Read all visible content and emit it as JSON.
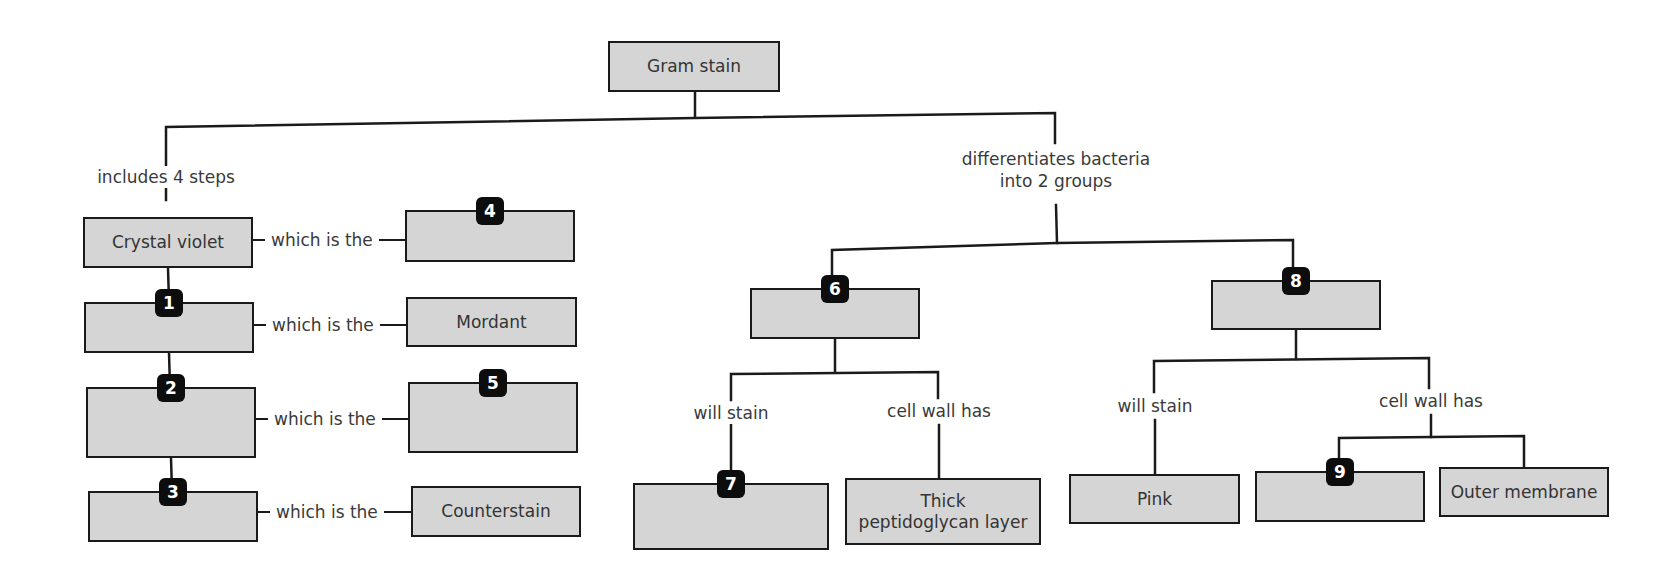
{
  "diagram": {
    "title": "Gram stain",
    "colors": {
      "box_fill": "#d5d5d5",
      "border": "#1a1a1a",
      "badge": "#0d0d0d",
      "badge_text": "#ffffff"
    },
    "root": {
      "label": "Gram stain",
      "x": 608,
      "y": 41,
      "w": 172,
      "h": 51
    },
    "edge_labels": {
      "includes": {
        "text": "includes 4 steps",
        "x": 166,
        "y": 177
      },
      "differentiates": {
        "text": "differentiates bacteria\ninto 2 groups",
        "x": 1056,
        "y": 170
      },
      "will_stain_left": {
        "text": "will stain",
        "x": 731,
        "y": 413
      },
      "cell_wall_left": {
        "text": "cell wall has",
        "x": 939,
        "y": 411
      },
      "will_stain_right": {
        "text": "will stain",
        "x": 1155,
        "y": 406
      },
      "cell_wall_right": {
        "text": "cell wall has",
        "x": 1431,
        "y": 401
      }
    },
    "steps": [
      {
        "name": "crystal-violet",
        "label": "Crystal violet",
        "badge": "",
        "x": 83,
        "y": 217,
        "w": 170,
        "h": 51
      },
      {
        "name": "step-1",
        "label": "",
        "badge": "1",
        "x": 84,
        "y": 302,
        "w": 170,
        "h": 51
      },
      {
        "name": "step-2",
        "label": "",
        "badge": "2",
        "x": 86,
        "y": 387,
        "w": 170,
        "h": 71
      },
      {
        "name": "step-3",
        "label": "",
        "badge": "3",
        "x": 88,
        "y": 491,
        "w": 170,
        "h": 51
      }
    ],
    "roles": [
      {
        "name": "role-4",
        "label": "",
        "badge": "4",
        "x": 405,
        "y": 210,
        "w": 170,
        "h": 52
      },
      {
        "name": "role-mordant",
        "label": "Mordant",
        "badge": "",
        "x": 406,
        "y": 297,
        "w": 171,
        "h": 50
      },
      {
        "name": "role-5",
        "label": "",
        "badge": "5",
        "x": 408,
        "y": 382,
        "w": 170,
        "h": 71
      },
      {
        "name": "role-counterstain",
        "label": "Counterstain",
        "badge": "",
        "x": 411,
        "y": 486,
        "w": 170,
        "h": 51
      }
    ],
    "connector_text": "which is the",
    "connectors": [
      {
        "y": 240,
        "x1": 253,
        "x2": 405
      },
      {
        "y": 325,
        "x1": 254,
        "x2": 406
      },
      {
        "y": 419,
        "x1": 256,
        "x2": 408
      },
      {
        "y": 512,
        "x1": 258,
        "x2": 411
      }
    ],
    "groups": [
      {
        "name": "group-6",
        "label": "",
        "badge": "6",
        "x": 750,
        "y": 288,
        "w": 170,
        "h": 51
      },
      {
        "name": "group-8",
        "label": "",
        "badge": "8",
        "x": 1211,
        "y": 280,
        "w": 170,
        "h": 50
      }
    ],
    "leaves": [
      {
        "name": "leaf-7",
        "label": "",
        "badge": "7",
        "x": 633,
        "y": 483,
        "w": 196,
        "h": 67
      },
      {
        "name": "leaf-thick-peptidoglycan",
        "label": "Thick\npeptidoglycan layer",
        "badge": "",
        "x": 845,
        "y": 478,
        "w": 196,
        "h": 67
      },
      {
        "name": "leaf-pink",
        "label": "Pink",
        "badge": "",
        "x": 1069,
        "y": 474,
        "w": 171,
        "h": 50
      },
      {
        "name": "leaf-9",
        "label": "",
        "badge": "9",
        "x": 1255,
        "y": 471,
        "w": 170,
        "h": 51
      },
      {
        "name": "leaf-outer-membrane",
        "label": "Outer membrane",
        "badge": "",
        "x": 1439,
        "y": 467,
        "w": 170,
        "h": 50
      }
    ]
  }
}
